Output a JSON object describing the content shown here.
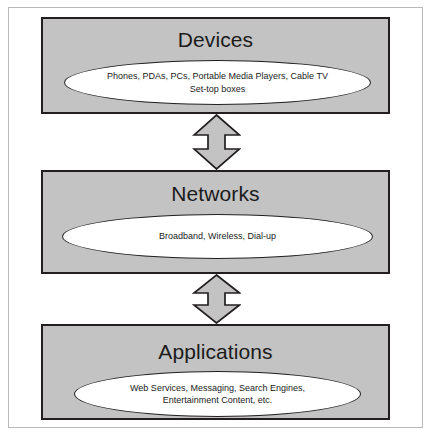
{
  "diagram": {
    "colors": {
      "box_fill": "#c3c3c3",
      "box_border": "#231f20",
      "ellipse_fill": "#ffffff",
      "arrow_fill": "#c3c3c3",
      "frame_border": "#b9b9b9",
      "text": "#1b1b1b"
    },
    "layers": [
      {
        "id": "devices",
        "title": "Devices",
        "items": "Phones, PDAs, PCs, Portable Media Players, Cable TV\nSet-top boxes"
      },
      {
        "id": "networks",
        "title": "Networks",
        "items": "Broadband, Wireless, Dial-up"
      },
      {
        "id": "applications",
        "title": "Applications",
        "items": "Web Services, Messaging, Search Engines,\nEntertainment Content, etc."
      }
    ],
    "connectors": [
      {
        "id": "devices-networks",
        "type": "double-headed-vertical-arrow",
        "from": "Devices",
        "to": "Networks"
      },
      {
        "id": "networks-applications",
        "type": "double-headed-vertical-arrow",
        "from": "Networks",
        "to": "Applications"
      }
    ]
  }
}
